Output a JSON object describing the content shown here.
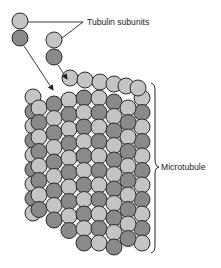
{
  "labels": {
    "tubulin_subunits": "Tubulin subunits",
    "microtubule": "Microtubule"
  },
  "colors": {
    "light_subunit": "#c4c4c4",
    "dark_subunit": "#8a8a8a",
    "outline": "#2a2a2a",
    "text": "#222222",
    "background": "#ffffff"
  },
  "free_dimers": [
    {
      "x": 20,
      "y_light": 21,
      "y_dark": 38
    },
    {
      "x": 54,
      "y_light": 40,
      "y_dark": 57
    }
  ],
  "lattice": {
    "columns": 7,
    "rows": 13,
    "radius": 8,
    "col_spacing": 15,
    "row_spacing": 14.5,
    "origin_x": 37,
    "origin_y": 100,
    "col_shift_y": -4
  }
}
